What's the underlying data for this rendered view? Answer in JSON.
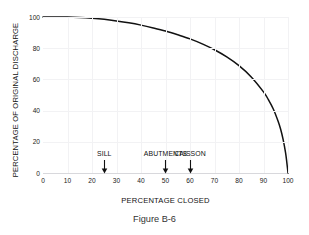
{
  "chart_data": {
    "type": "line",
    "title": "",
    "xlabel": "PERCENTAGE CLOSED",
    "ylabel": "PERCENTAGE OF ORIGINAL DISCHARGE",
    "xlim": [
      0,
      100
    ],
    "ylim": [
      0,
      100
    ],
    "xticks": [
      0,
      10,
      20,
      30,
      40,
      50,
      60,
      70,
      80,
      90,
      100
    ],
    "yticks": [
      0,
      20,
      40,
      60,
      80,
      100
    ],
    "grid": true,
    "legend": null,
    "line_color": "#111111",
    "x": [
      0,
      5,
      10,
      15,
      20,
      25,
      30,
      35,
      40,
      45,
      50,
      55,
      60,
      65,
      70,
      75,
      80,
      85,
      90,
      92,
      94,
      96,
      97,
      98,
      99,
      99.5,
      100
    ],
    "values": [
      100,
      100,
      100,
      99.7,
      99.2,
      98.5,
      97.5,
      96.3,
      94.8,
      93.0,
      91.0,
      88.6,
      86.0,
      82.8,
      79.0,
      74.4,
      68.8,
      61.6,
      52.0,
      47.0,
      41.0,
      33.0,
      28.0,
      21.5,
      13.0,
      7.0,
      0
    ],
    "annotations": [
      {
        "label": "SILL",
        "x": 25
      },
      {
        "label": "ABUTMENTS",
        "x": 50
      },
      {
        "label": "CAISSON",
        "x": 60
      }
    ]
  },
  "caption": "Figure B-6"
}
